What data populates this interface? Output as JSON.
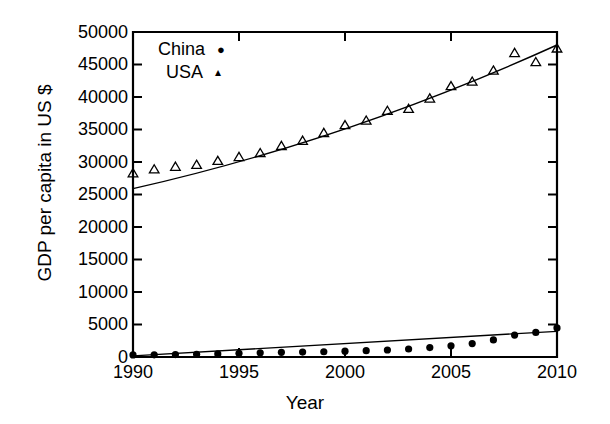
{
  "chart_data": {
    "type": "scatter",
    "title": "",
    "xlabel": "Year",
    "ylabel": "GDP per capita in US $",
    "xlim": [
      1990,
      2010
    ],
    "ylim": [
      0,
      50000
    ],
    "xticks": [
      1990,
      1995,
      2000,
      2005,
      2010
    ],
    "xtick_labels": [
      "1990",
      "1995",
      "2000",
      "2005",
      "2010"
    ],
    "yticks": [
      0,
      5000,
      10000,
      15000,
      20000,
      25000,
      30000,
      35000,
      40000,
      45000,
      50000
    ],
    "ytick_labels": [
      "0",
      "5000",
      "10000",
      "15000",
      "20000",
      "25000",
      "30000",
      "35000",
      "40000",
      "45000",
      "50000"
    ],
    "grid": false,
    "legend_position": "upper-left-inside",
    "x": [
      1990,
      1991,
      1992,
      1993,
      1994,
      1995,
      1996,
      1997,
      1998,
      1999,
      2000,
      2001,
      2002,
      2003,
      2004,
      2005,
      2006,
      2007,
      2008,
      2009,
      2010
    ],
    "series": [
      {
        "name": "China",
        "marker": "circle",
        "marker_label": "●",
        "color": "#000000",
        "values": [
          320,
          340,
          370,
          420,
          470,
          560,
          650,
          720,
          760,
          810,
          900,
          980,
          1080,
          1230,
          1450,
          1720,
          2070,
          2620,
          3380,
          3780,
          4480
        ],
        "fit_line": {
          "type": "linear",
          "start": [
            1990,
            180
          ],
          "end": [
            2010,
            3950
          ]
        }
      },
      {
        "name": "USA",
        "marker": "triangle",
        "marker_label": "▲",
        "color": "#000000",
        "values": [
          28300,
          28900,
          29300,
          29600,
          30200,
          30800,
          31400,
          32500,
          33300,
          34500,
          35700,
          36400,
          37900,
          38200,
          39800,
          41700,
          42400,
          44100,
          46800,
          45400,
          47500
        ],
        "fit_line": {
          "type": "quadratic",
          "start": [
            1990,
            25900
          ],
          "end": [
            2010,
            48000
          ],
          "mid": [
            2000,
            35100
          ]
        }
      }
    ],
    "annotations": []
  },
  "legend": {
    "items": [
      {
        "label": "China",
        "marker": "●"
      },
      {
        "label": "USA",
        "marker": "▴"
      }
    ]
  },
  "axes": {
    "frame_color": "#000000"
  }
}
